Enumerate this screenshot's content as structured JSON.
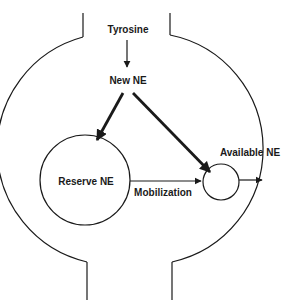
{
  "diagram": {
    "labels": {
      "precursor": "Tyrosine",
      "new_ne": "New NE",
      "reserve_ne": "Reserve NE",
      "mobilization": "Mobilization",
      "available_ne": "Available NE"
    },
    "colors": {
      "stroke": "#1a1a1a",
      "background": "#ffffff"
    }
  }
}
